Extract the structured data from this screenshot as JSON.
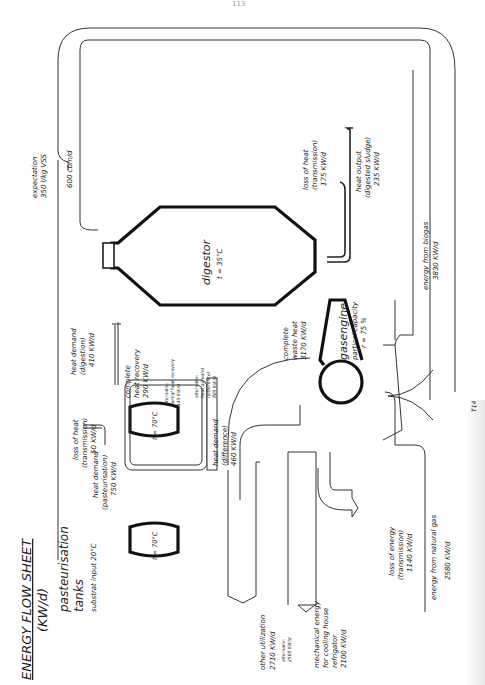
{
  "page": {
    "page_number": "113",
    "title": "ENERGY FLOW SHEET",
    "unit": "(KW/d)"
  },
  "digestor": {
    "name": "digestor",
    "temp": "t = 35°C"
  },
  "expectation": {
    "line1": "expectation",
    "line2": "350 l/kg VSS",
    "volume": "600 cbm/d"
  },
  "pasteurisation": {
    "name": "pasteurisation",
    "name2": "tanks",
    "substrat": "substrat input  20°C",
    "tank1_temp": "t = 70°C",
    "tank2_temp": "t = 70°C"
  },
  "flows": {
    "heat_demand_past": [
      "heat demand",
      "(pasteurisation)",
      "750 KW/d"
    ],
    "loss_heat_trans": [
      "loss of heat",
      "(transmission)",
      "50 KW/d"
    ],
    "heat_demand_digestion": [
      "heat demand",
      "(digestion)",
      "410 KW/d"
    ],
    "complete_heat_recovery": [
      "complete",
      "heat recovery",
      "290 KW/d"
    ],
    "alt_partial_recovery": [
      "alternativ:",
      "partial heat recovery",
      "145 KW/d"
    ],
    "alt_heat_demand_diff": [
      "alternativ:",
      "heat demand",
      "(difference)",
      "805 KW/d"
    ],
    "heat_demand_diff": [
      "heat demand",
      "(difference)",
      "460 KW/d"
    ],
    "complete_waste_heat": [
      "complete",
      "waste heat",
      "3170 KW/d"
    ],
    "gasengine": [
      "gasengine",
      "partical capacity",
      "r = 75 %"
    ],
    "loss_heat_digestor": [
      "loss of heat",
      "(transmission)",
      "175 KW/d"
    ],
    "heat_output_sludge": [
      "heat output",
      "(digested sludge)",
      "235 KW/d"
    ],
    "energy_biogas": [
      "energy from biogas",
      "3830 KW/d"
    ],
    "energy_natural_gas": [
      "energy from natural gas",
      "2580 KW/d"
    ],
    "loss_energy_trans": [
      "loss of energy",
      "(transmission)",
      "1140 KW/d"
    ],
    "mechanical_energy": [
      "mechanical energy",
      "for cooling house",
      "refrigator",
      "2100 KW/d"
    ],
    "other_utilization": [
      "other utilization",
      "2710 KW/d"
    ],
    "alt_other_util": [
      "alternativ:",
      "2565 KW/d"
    ]
  },
  "margin_mark": "T14"
}
